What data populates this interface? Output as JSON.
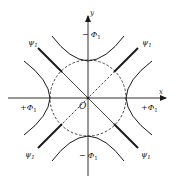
{
  "diagram": {
    "colors": {
      "ink": "#1a1a1a",
      "background": "#ffffff"
    },
    "axes": {
      "x_label": "x",
      "y_label": "y",
      "origin_label": "O"
    },
    "labels": {
      "top": {
        "sign": "−",
        "symbol": "Φ",
        "sub": "1"
      },
      "bottom": {
        "sign": "−",
        "symbol": "Φ",
        "sub": "1"
      },
      "left": {
        "sign": "+",
        "symbol": "Φ",
        "sub": "1"
      },
      "right": {
        "sign": "+",
        "symbol": "Φ",
        "sub": "1"
      },
      "psi_top_left": {
        "symbol": "ψ",
        "sub": "1"
      },
      "psi_top_right": {
        "symbol": "ψ",
        "sub": "1"
      },
      "psi_bottom_left": {
        "symbol": "ψ",
        "sub": "1"
      },
      "psi_bottom_right": {
        "symbol": "ψ",
        "sub": "1"
      }
    },
    "geometry": {
      "origin": [
        88,
        98
      ],
      "circle_radius": 38,
      "circle_style": "dashed",
      "hyperbola_arcs": [
        "top",
        "bottom",
        "left",
        "right"
      ],
      "asymptotes": [
        "NW-SE solid inside circle",
        "NE-SW dashed inside circle",
        "thick segments outside labelled ψ1"
      ]
    }
  }
}
